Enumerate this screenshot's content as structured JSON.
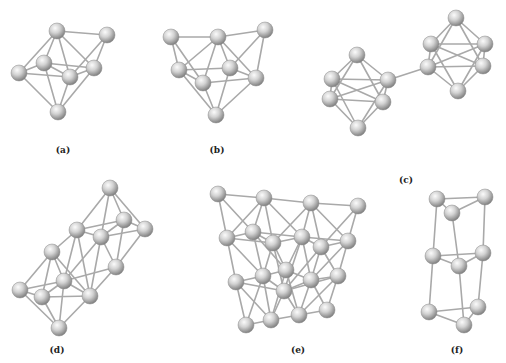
{
  "figure": {
    "colors": {
      "atom_fill_light": "#f2f2f2",
      "atom_fill_dark": "#8a8a8a",
      "bond": "#a9a9a9",
      "label": "#222222"
    },
    "atom_radius": 8,
    "panels": [
      {
        "label": "(a)",
        "label_pos": [
          63,
          153
        ],
        "atoms": [
          [
            57,
            31
          ],
          [
            107,
            35
          ],
          [
            44,
            63
          ],
          [
            94,
            68
          ],
          [
            19,
            73
          ],
          [
            70,
            77
          ],
          [
            58,
            112
          ]
        ],
        "bonds": [
          [
            0,
            1
          ],
          [
            0,
            2
          ],
          [
            0,
            3
          ],
          [
            0,
            4
          ],
          [
            0,
            5
          ],
          [
            1,
            3
          ],
          [
            1,
            5
          ],
          [
            2,
            3
          ],
          [
            2,
            4
          ],
          [
            2,
            5
          ],
          [
            2,
            6
          ],
          [
            3,
            5
          ],
          [
            3,
            6
          ],
          [
            4,
            5
          ],
          [
            4,
            6
          ],
          [
            5,
            6
          ]
        ]
      },
      {
        "label": "(b)",
        "label_pos": [
          217,
          153
        ],
        "atoms": [
          [
            171,
            37
          ],
          [
            218,
            37
          ],
          [
            265,
            30
          ],
          [
            179,
            70
          ],
          [
            230,
            68
          ],
          [
            203,
            83
          ],
          [
            256,
            78
          ],
          [
            216,
            115
          ]
        ],
        "bonds": [
          [
            0,
            1
          ],
          [
            1,
            2
          ],
          [
            0,
            3
          ],
          [
            0,
            5
          ],
          [
            1,
            3
          ],
          [
            1,
            4
          ],
          [
            1,
            5
          ],
          [
            1,
            6
          ],
          [
            2,
            4
          ],
          [
            2,
            6
          ],
          [
            3,
            4
          ],
          [
            3,
            5
          ],
          [
            3,
            7
          ],
          [
            4,
            6
          ],
          [
            4,
            7
          ],
          [
            5,
            6
          ],
          [
            5,
            7
          ],
          [
            6,
            7
          ]
        ]
      },
      {
        "label": "(c)",
        "label_pos": [
          406,
          183
        ],
        "atoms": [
          [
            357,
            55
          ],
          [
            332,
            79
          ],
          [
            388,
            80
          ],
          [
            330,
            99
          ],
          [
            383,
            102
          ],
          [
            358,
            128
          ],
          [
            456,
            18
          ],
          [
            431,
            44
          ],
          [
            485,
            44
          ],
          [
            428,
            67
          ],
          [
            483,
            66
          ],
          [
            458,
            91
          ]
        ],
        "bonds": [
          [
            0,
            1
          ],
          [
            0,
            2
          ],
          [
            0,
            3
          ],
          [
            0,
            4
          ],
          [
            1,
            2
          ],
          [
            1,
            3
          ],
          [
            2,
            4
          ],
          [
            3,
            4
          ],
          [
            1,
            5
          ],
          [
            2,
            5
          ],
          [
            3,
            5
          ],
          [
            4,
            5
          ],
          [
            1,
            4
          ],
          [
            2,
            3
          ],
          [
            6,
            7
          ],
          [
            6,
            8
          ],
          [
            6,
            9
          ],
          [
            6,
            10
          ],
          [
            7,
            8
          ],
          [
            7,
            9
          ],
          [
            8,
            10
          ],
          [
            9,
            10
          ],
          [
            7,
            11
          ],
          [
            8,
            11
          ],
          [
            9,
            11
          ],
          [
            10,
            11
          ],
          [
            7,
            10
          ],
          [
            8,
            9
          ],
          [
            2,
            9
          ]
        ]
      },
      {
        "label": "(d)",
        "label_pos": [
          57,
          353
        ],
        "atoms": [
          [
            110,
            188
          ],
          [
            124,
            220
          ],
          [
            145,
            229
          ],
          [
            77,
            230
          ],
          [
            101,
            237
          ],
          [
            116,
            267
          ],
          [
            52,
            252
          ],
          [
            64,
            281
          ],
          [
            90,
            296
          ],
          [
            20,
            290
          ],
          [
            42,
            297
          ],
          [
            59,
            328
          ]
        ],
        "bonds": [
          [
            0,
            1
          ],
          [
            0,
            2
          ],
          [
            0,
            3
          ],
          [
            0,
            4
          ],
          [
            1,
            2
          ],
          [
            1,
            3
          ],
          [
            1,
            4
          ],
          [
            1,
            5
          ],
          [
            2,
            4
          ],
          [
            2,
            5
          ],
          [
            3,
            4
          ],
          [
            3,
            6
          ],
          [
            3,
            7
          ],
          [
            3,
            8
          ],
          [
            4,
            5
          ],
          [
            4,
            7
          ],
          [
            4,
            8
          ],
          [
            5,
            7
          ],
          [
            5,
            8
          ],
          [
            6,
            7
          ],
          [
            6,
            9
          ],
          [
            6,
            10
          ],
          [
            6,
            8
          ],
          [
            7,
            8
          ],
          [
            7,
            9
          ],
          [
            7,
            10
          ],
          [
            8,
            10
          ],
          [
            8,
            11
          ],
          [
            9,
            10
          ],
          [
            9,
            11
          ],
          [
            10,
            11
          ],
          [
            7,
            11
          ]
        ]
      },
      {
        "label": "(e)",
        "label_pos": [
          298,
          353
        ],
        "atoms": [
          [
            218,
            194
          ],
          [
            264,
            198
          ],
          [
            311,
            203
          ],
          [
            358,
            206
          ],
          [
            227,
            238
          ],
          [
            253,
            232
          ],
          [
            273,
            243
          ],
          [
            302,
            237
          ],
          [
            321,
            247
          ],
          [
            348,
            241
          ],
          [
            236,
            282
          ],
          [
            263,
            276
          ],
          [
            286,
            270
          ],
          [
            284,
            291
          ],
          [
            311,
            280
          ],
          [
            338,
            276
          ],
          [
            246,
            325
          ],
          [
            271,
            320
          ],
          [
            299,
            315
          ],
          [
            327,
            310
          ]
        ],
        "bonds": [
          [
            0,
            1
          ],
          [
            1,
            2
          ],
          [
            2,
            3
          ],
          [
            0,
            4
          ],
          [
            0,
            5
          ],
          [
            1,
            4
          ],
          [
            1,
            5
          ],
          [
            1,
            6
          ],
          [
            1,
            7
          ],
          [
            2,
            6
          ],
          [
            2,
            7
          ],
          [
            2,
            8
          ],
          [
            2,
            9
          ],
          [
            3,
            8
          ],
          [
            3,
            9
          ],
          [
            4,
            5
          ],
          [
            5,
            6
          ],
          [
            6,
            7
          ],
          [
            7,
            8
          ],
          [
            8,
            9
          ],
          [
            4,
            10
          ],
          [
            4,
            11
          ],
          [
            5,
            11
          ],
          [
            5,
            12
          ],
          [
            6,
            11
          ],
          [
            6,
            12
          ],
          [
            6,
            13
          ],
          [
            7,
            12
          ],
          [
            7,
            13
          ],
          [
            7,
            14
          ],
          [
            8,
            13
          ],
          [
            8,
            14
          ],
          [
            8,
            15
          ],
          [
            9,
            14
          ],
          [
            9,
            15
          ],
          [
            10,
            11
          ],
          [
            11,
            12
          ],
          [
            12,
            14
          ],
          [
            13,
            14
          ],
          [
            14,
            15
          ],
          [
            11,
            13
          ],
          [
            10,
            16
          ],
          [
            10,
            17
          ],
          [
            11,
            16
          ],
          [
            11,
            17
          ],
          [
            12,
            17
          ],
          [
            12,
            18
          ],
          [
            13,
            17
          ],
          [
            13,
            18
          ],
          [
            14,
            18
          ],
          [
            14,
            19
          ],
          [
            15,
            18
          ],
          [
            15,
            19
          ],
          [
            16,
            17
          ],
          [
            17,
            18
          ],
          [
            18,
            19
          ],
          [
            4,
            6
          ],
          [
            5,
            7
          ],
          [
            7,
            9
          ],
          [
            10,
            13
          ],
          [
            13,
            15
          ]
        ]
      },
      {
        "label": "(f)",
        "label_pos": [
          457,
          353
        ],
        "atoms": [
          [
            437,
            199
          ],
          [
            485,
            197
          ],
          [
            452,
            213
          ],
          [
            433,
            256
          ],
          [
            483,
            253
          ],
          [
            459,
            266
          ],
          [
            429,
            312
          ],
          [
            478,
            307
          ],
          [
            464,
            325
          ]
        ],
        "bonds": [
          [
            0,
            1
          ],
          [
            0,
            2
          ],
          [
            1,
            2
          ],
          [
            0,
            3
          ],
          [
            1,
            4
          ],
          [
            2,
            5
          ],
          [
            3,
            4
          ],
          [
            3,
            5
          ],
          [
            4,
            5
          ],
          [
            3,
            6
          ],
          [
            4,
            7
          ],
          [
            5,
            8
          ],
          [
            6,
            7
          ],
          [
            6,
            8
          ],
          [
            7,
            8
          ]
        ]
      }
    ]
  }
}
